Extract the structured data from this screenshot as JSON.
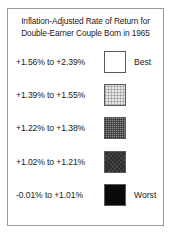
{
  "legend": {
    "title_lines": [
      "Inflation-Adjusted Rate of Return for",
      "Double-Earner Couple Born in 1965"
    ],
    "rows": [
      {
        "range": "+1.56% to +2.39%",
        "rank": "Best",
        "swatch": "white-swatch",
        "color": "#ffffff"
      },
      {
        "range": "+1.39% to +1.55%",
        "rank": "",
        "swatch": "light-gray-swatch",
        "color": "#e9e9e9"
      },
      {
        "range": "+1.22% to +1.38%",
        "rank": "",
        "swatch": "medium-gray-swatch",
        "color": "#8d8d8d"
      },
      {
        "range": "+1.02% to +1.21%",
        "rank": "",
        "swatch": "dark-gray-swatch",
        "color": "#2a2a2a"
      },
      {
        "range": "-0.01% to +1.01%",
        "rank": "Worst",
        "swatch": "black-swatch",
        "color": "#0a0a0a"
      }
    ],
    "border_color": "#9a9a9a",
    "text_color": "#1a1a1a"
  },
  "chart_data": {
    "type": "table",
    "title": "Inflation-Adjusted Rate of Return for Double-Earner Couple Born in 1965",
    "xlabel": "",
    "ylabel": "",
    "legend_position": "standalone",
    "grid": false,
    "categories": [
      "+1.56% to +2.39%",
      "+1.39% to +1.55%",
      "+1.22% to +1.38%",
      "+1.02% to +1.21%",
      "-0.01% to +1.01%"
    ],
    "bin_bounds": [
      [
        1.56,
        2.39
      ],
      [
        1.39,
        1.55
      ],
      [
        1.22,
        1.38
      ],
      [
        1.02,
        1.21
      ],
      [
        -0.01,
        1.01
      ]
    ],
    "colors": [
      "#ffffff",
      "#e9e9e9",
      "#8d8d8d",
      "#2a2a2a",
      "#0a0a0a"
    ],
    "endpoint_labels": {
      "first": "Best",
      "last": "Worst"
    },
    "units": "percent",
    "value_range": [
      -0.01,
      2.39
    ]
  }
}
